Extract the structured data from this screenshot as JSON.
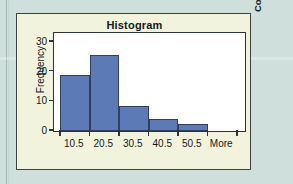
{
  "figure": {
    "title": "Histogram",
    "copyright": "Copyright © Cengage Learning 2013",
    "card_bg": "#f2f3dd",
    "page_bg": "#cfe0dc",
    "plot_bg": "#ffffff",
    "frame_color": "#2b3334"
  },
  "chart_data": {
    "type": "bar",
    "title": "Histogram",
    "xlabel": "",
    "ylabel": "Frequency",
    "categories": [
      "10.5",
      "20.5",
      "30.5",
      "40.5",
      "50.5",
      "More"
    ],
    "values": [
      19,
      25.5,
      8.5,
      4,
      2.5,
      0
    ],
    "ylim": [
      0,
      33
    ],
    "yticks": [
      0,
      10,
      20,
      30
    ],
    "ytick_labels": [
      "0",
      "10",
      "20",
      "30"
    ],
    "xtick_labels": [
      "10.5",
      "20.5",
      "30.5",
      "40.5",
      "50.5",
      "More"
    ],
    "grid": false,
    "legend": false,
    "bar_color": "#5c7ab6",
    "bar_edge_color": "#2f3f5f"
  },
  "axes": {
    "y_title": "Frequency",
    "y_labels": [
      "30",
      "20",
      "10",
      "0"
    ],
    "x_labels": [
      "10.5",
      "20.5",
      "30.5",
      "40.5",
      "50.5",
      "More"
    ]
  }
}
